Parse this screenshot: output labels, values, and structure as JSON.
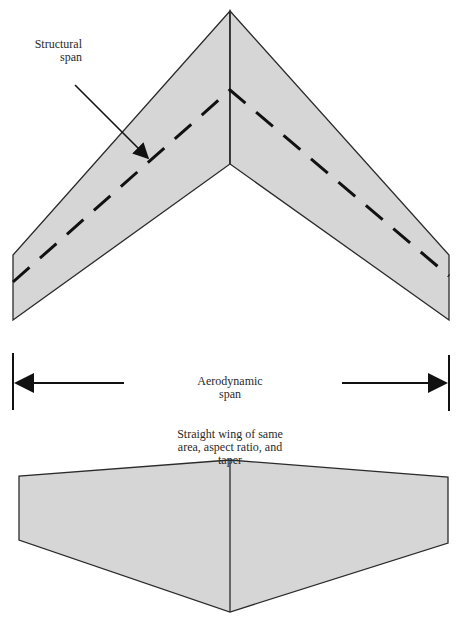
{
  "labels": {
    "structural_span": [
      "Structural",
      "span"
    ],
    "aerodynamic_span": [
      "Aerodynamic",
      "span"
    ],
    "straight_wing": [
      "Straight wing of same",
      "area, aspect ratio, and",
      "taper"
    ]
  },
  "colors": {
    "wing_fill": "#d6d6d6",
    "outline": "#2b2b2b",
    "dash": "#111111",
    "background": "#ffffff"
  },
  "swept_wing": {
    "apex": [
      230,
      11
    ],
    "trailing_apex": [
      230,
      164
    ],
    "left_tip": [
      [
        13,
        255
      ],
      [
        13,
        320
      ]
    ],
    "right_tip": [
      [
        449,
        255
      ],
      [
        449,
        320
      ]
    ],
    "structural_line": [
      [
        13,
        282
      ],
      [
        230,
        90
      ],
      [
        449,
        276
      ]
    ]
  },
  "aerodynamic_span_marker": {
    "left_x": 13,
    "right_x": 449,
    "y": 383
  },
  "straight_wing": {
    "apex": [
      230,
      460
    ],
    "root_bottom": [
      230,
      612
    ],
    "left_tip": [
      [
        19,
        476
      ],
      [
        19,
        540
      ]
    ],
    "right_tip": [
      [
        448,
        477
      ],
      [
        448,
        543
      ]
    ]
  }
}
